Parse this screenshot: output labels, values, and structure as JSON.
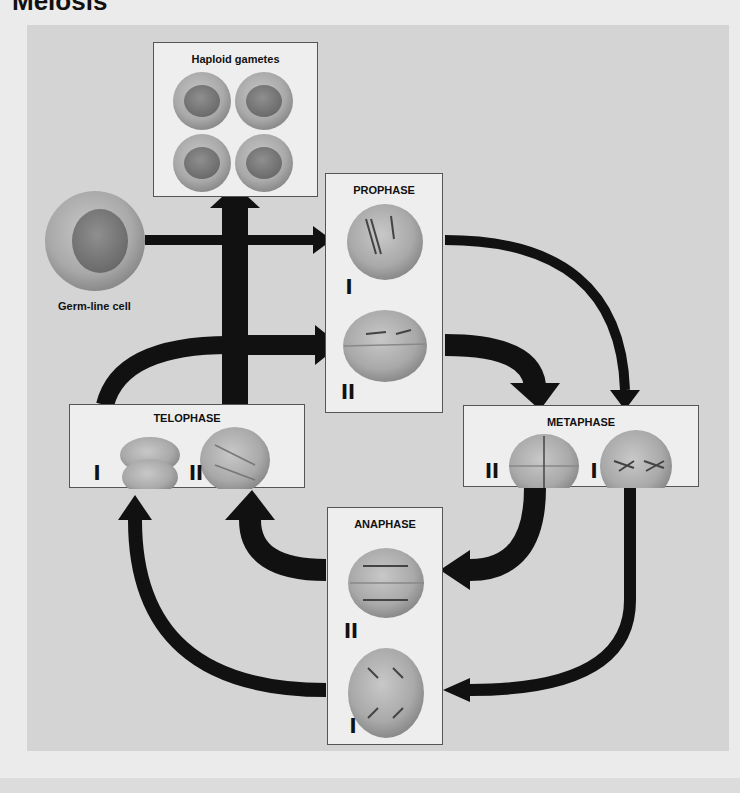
{
  "title": "Meiosis",
  "germ_line_label": "Germ-line cell",
  "boxes": {
    "gametes": {
      "title": "Haploid gametes"
    },
    "prophase": {
      "title": "PROPHASE",
      "stage_top": "I",
      "stage_bottom": "II"
    },
    "metaphase": {
      "title": "METAPHASE",
      "stage_left": "II",
      "stage_right": "I"
    },
    "anaphase": {
      "title": "ANAPHASE",
      "stage_top": "II",
      "stage_bottom": "I"
    },
    "telophase": {
      "title": "TELOPHASE",
      "stage_left": "I",
      "stage_right": "II"
    }
  },
  "colors": {
    "background": "#d4d4d4",
    "box": "#eeeeee",
    "arrow": "#111111",
    "cell": "#a8a8a8",
    "nucleus": "#7e7e7e"
  }
}
